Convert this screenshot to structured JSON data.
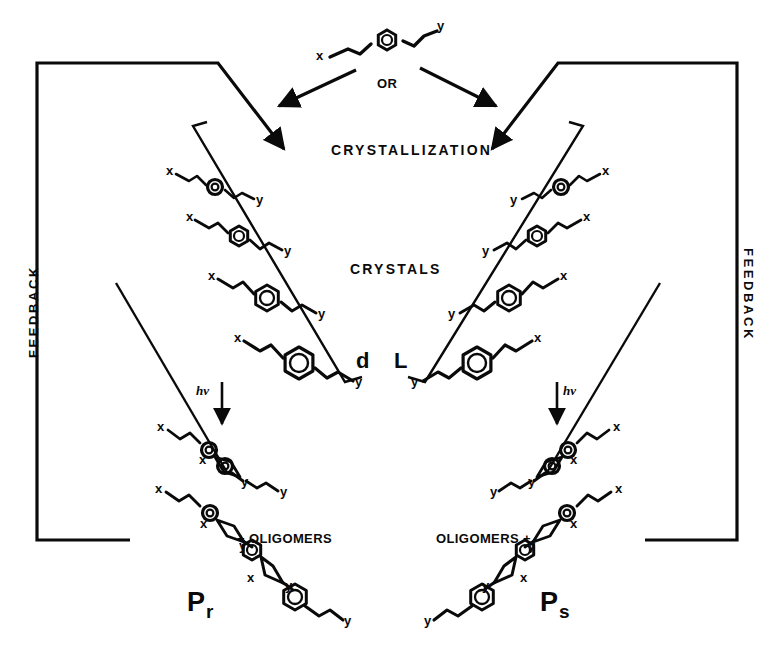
{
  "diagram": {
    "ink_color": "#0a0a0a",
    "background": "#ffffff",
    "monomer": {
      "label_left": "x",
      "label_right": "y",
      "core": "benzene-ring",
      "description": "x-CH=CH-C6H4-CH=CH-y divinylbenzene type monomer"
    },
    "branch_label": "OR",
    "process_labels": {
      "crystallization": "CRYSTALLIZATION",
      "crystals": "CRYSTALS",
      "photolysis": "hv"
    },
    "chirality": {
      "left": "d",
      "right": "L"
    },
    "feedback": {
      "left": "FEEDBACK",
      "right": "FEEDBACK"
    },
    "products": {
      "left": {
        "symbol": "P",
        "subscript": "r",
        "byproduct": "+ OLIGOMERS"
      },
      "right": {
        "symbol": "P",
        "subscript": "s",
        "byproduct": "OLIGOMERS +"
      }
    },
    "stack_left": {
      "count": 4,
      "monomer_end_labels": [
        "x",
        "y"
      ],
      "note": "four stacked monomers, x at upper-left, y at lower-right"
    },
    "stack_right": {
      "count": 4,
      "monomer_end_labels": [
        "y",
        "x"
      ],
      "note": "mirror image, y at lower-left, x at upper-right"
    },
    "polymer_left": {
      "units": 3,
      "end_labels": [
        "x",
        "y"
      ],
      "linkage": "cyclobutane"
    },
    "polymer_right": {
      "units": 3,
      "end_labels": [
        "y",
        "x"
      ],
      "linkage": "cyclobutane"
    }
  }
}
